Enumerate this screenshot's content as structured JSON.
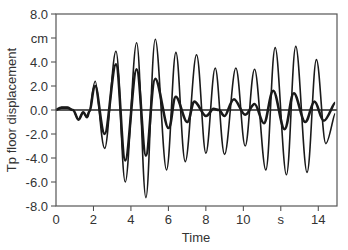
{
  "chart_data": {
    "type": "line",
    "title": "",
    "xlabel": "Time",
    "ylabel": "Tp floor displacement",
    "x_unit": "s",
    "y_unit": "cm",
    "xlim": [
      0,
      15
    ],
    "ylim": [
      -8.0,
      8.0
    ],
    "x_ticks": [
      "0",
      "2",
      "4",
      "6",
      "8",
      "10",
      "s",
      "14"
    ],
    "x_tick_values": [
      0,
      2,
      4,
      6,
      8,
      10,
      12,
      14
    ],
    "y_ticks": [
      "8.0",
      "cm",
      "4.0",
      "2.0",
      "0.0",
      "-2.0",
      "-4.0",
      "-6.0",
      "-8.0"
    ],
    "y_tick_values": [
      8,
      6,
      4,
      2,
      0,
      -2,
      -4,
      -6,
      -8
    ],
    "grid": false,
    "zero_line": true,
    "legend": null,
    "series": [
      {
        "name": "thin",
        "stroke_width": 1.6,
        "points": [
          [
            0,
            0
          ],
          [
            0.3,
            0.2
          ],
          [
            0.6,
            0.2
          ],
          [
            0.9,
            0.0
          ],
          [
            1.2,
            -0.8
          ],
          [
            1.45,
            -0.2
          ],
          [
            1.65,
            -0.6
          ],
          [
            1.8,
            -0.1
          ],
          [
            2.1,
            2.4
          ],
          [
            2.6,
            -3.2
          ],
          [
            3.2,
            4.9
          ],
          [
            3.7,
            -6.0
          ],
          [
            4.3,
            5.6
          ],
          [
            4.8,
            -7.3
          ],
          [
            5.3,
            5.9
          ],
          [
            5.9,
            -5.0
          ],
          [
            6.4,
            4.8
          ],
          [
            6.9,
            -4.3
          ],
          [
            7.5,
            4.6
          ],
          [
            8.0,
            -3.6
          ],
          [
            8.5,
            3.5
          ],
          [
            9.0,
            -3.7
          ],
          [
            9.6,
            3.5
          ],
          [
            10.1,
            -3.0
          ],
          [
            10.6,
            3.4
          ],
          [
            11.2,
            -5.0
          ],
          [
            11.7,
            5.2
          ],
          [
            12.3,
            -5.4
          ],
          [
            12.8,
            5.3
          ],
          [
            13.4,
            -5.2
          ],
          [
            13.9,
            4.2
          ],
          [
            14.4,
            -2.8
          ],
          [
            14.9,
            -0.3
          ]
        ]
      },
      {
        "name": "thick",
        "stroke_width": 2.6,
        "points": [
          [
            0,
            0
          ],
          [
            0.3,
            0.2
          ],
          [
            0.6,
            0.2
          ],
          [
            0.9,
            0.0
          ],
          [
            1.2,
            -0.8
          ],
          [
            1.45,
            -0.2
          ],
          [
            1.65,
            -0.6
          ],
          [
            1.8,
            -0.1
          ],
          [
            2.1,
            2.0
          ],
          [
            2.6,
            -2.0
          ],
          [
            3.2,
            3.8
          ],
          [
            3.7,
            -4.2
          ],
          [
            4.3,
            3.4
          ],
          [
            4.8,
            -3.8
          ],
          [
            5.3,
            2.6
          ],
          [
            6.0,
            -1.5
          ],
          [
            6.4,
            1.1
          ],
          [
            7.0,
            -1.0
          ],
          [
            7.4,
            0.7
          ],
          [
            8.0,
            -0.5
          ],
          [
            8.4,
            0.1
          ],
          [
            8.7,
            0.0
          ],
          [
            9.0,
            -0.5
          ],
          [
            9.5,
            0.9
          ],
          [
            10.1,
            -0.4
          ],
          [
            10.6,
            0.5
          ],
          [
            11.1,
            -1.1
          ],
          [
            11.6,
            1.6
          ],
          [
            12.2,
            -1.6
          ],
          [
            12.7,
            1.4
          ],
          [
            13.3,
            -1.0
          ],
          [
            13.8,
            0.7
          ],
          [
            14.3,
            -0.9
          ],
          [
            14.9,
            0.6
          ]
        ]
      }
    ]
  },
  "axes": {
    "xlabel": "Time",
    "ylabel": "Tp floor displacement"
  }
}
